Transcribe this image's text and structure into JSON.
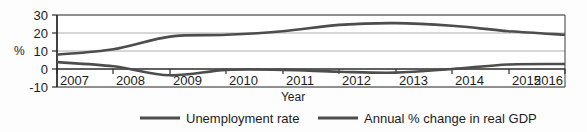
{
  "chart_data": {
    "type": "line",
    "title": "",
    "xlabel": "Year",
    "ylabel": "%",
    "categories": [
      "2007",
      "2008",
      "2009",
      "2010",
      "2011",
      "2012",
      "2013",
      "2014",
      "2015",
      "2016"
    ],
    "x": [
      2007,
      2008,
      2009,
      2010,
      2011,
      2012,
      2013,
      2014,
      2015,
      2016
    ],
    "series": [
      {
        "name": "Unemployment rate",
        "color": "#4d4d4d",
        "values": [
          8,
          11,
          18,
          19,
          21,
          24.5,
          25.5,
          24,
          21,
          19
        ]
      },
      {
        "name": "Annual % change in real GDP",
        "color": "#4d4d4d",
        "values": [
          3.8,
          1.5,
          -3.5,
          -0.5,
          -0.5,
          -1.5,
          -2,
          0,
          2.5,
          2.8
        ]
      }
    ],
    "ylim": [
      -10,
      30
    ],
    "yticks": [
      -10,
      0,
      10,
      20,
      30
    ],
    "ytick_labels": [
      "-10",
      "0",
      "10",
      "20",
      "30"
    ],
    "xtick_labels": [
      "2007",
      "2008",
      "2009",
      "2010",
      "2011",
      "2012",
      "2013",
      "2014",
      "2015",
      "2016"
    ],
    "grid": true,
    "grid_axis": "y",
    "legend_position": "bottom",
    "legend_entries": [
      "Unemployment rate",
      "Annual % change in real GDP"
    ]
  },
  "axis": {
    "y_title": "%",
    "x_title": "Year"
  },
  "legend": {
    "items": [
      {
        "label": "Unemployment rate"
      },
      {
        "label": "Annual % change in real GDP"
      }
    ]
  }
}
